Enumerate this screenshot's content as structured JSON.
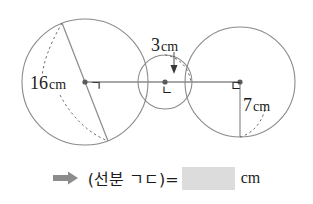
{
  "figure": {
    "type": "three-tangent-circles-diagram",
    "circles": [
      {
        "center_label": "ㄱ",
        "measure_label": "16",
        "measure_unit": "cm",
        "measure_kind": "diameter",
        "cx": 85,
        "cy": 82,
        "r": 63
      },
      {
        "center_label": "ㄴ",
        "measure_label": "3",
        "measure_unit": "cm",
        "measure_kind": "radius",
        "cx": 165,
        "cy": 82,
        "r": 27
      },
      {
        "center_label": "ㄷ",
        "measure_label": "7",
        "measure_unit": "cm",
        "measure_kind": "radius",
        "cx": 240,
        "cy": 82,
        "r": 55
      }
    ],
    "stroke_color": "#8a8a8a",
    "text_color": "#1b1b1b"
  },
  "answer": {
    "arrow_icon": "right-arrow-icon",
    "arrow_color": "#8c8c8c",
    "prompt": "(선분 ㄱㄷ)=",
    "blank_value": "",
    "blank_color": "#dcdcdc",
    "unit": "cm"
  }
}
